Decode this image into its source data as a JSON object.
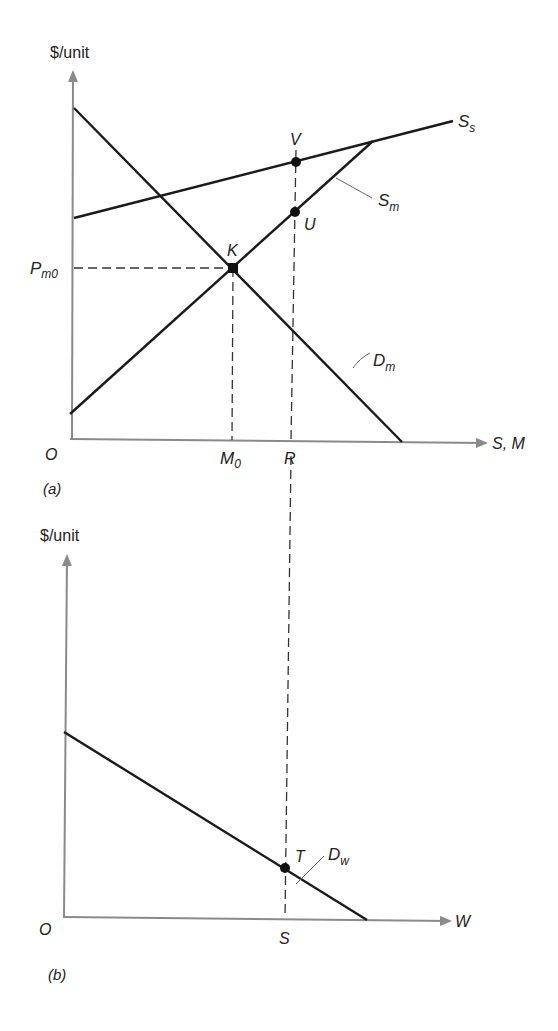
{
  "panel_a": {
    "caption": "(a)",
    "y_axis_label": "$/unit",
    "x_axis_label": "S, M",
    "origin_label": "O",
    "price_label_main": "P",
    "price_label_sub": "m0",
    "x_marks": {
      "m0_main": "M",
      "m0_sub": "0",
      "r": "R"
    },
    "curves": {
      "supply_s_main": "S",
      "supply_s_sub": "s",
      "supply_m_main": "S",
      "supply_m_sub": "m",
      "demand_m_main": "D",
      "demand_m_sub": "m"
    },
    "points": {
      "k": "K",
      "u": "U",
      "v": "V"
    }
  },
  "panel_b": {
    "caption": "(b)",
    "y_axis_label": "$/unit",
    "x_axis_label": "W",
    "origin_label": "O",
    "x_marks": {
      "s": "S"
    },
    "curves": {
      "demand_w_main": "D",
      "demand_w_sub": "w"
    },
    "points": {
      "t": "T"
    }
  },
  "colors": {
    "axis": "#8a8a8a",
    "curve": "#1a1a1a",
    "background": "#ffffff"
  }
}
